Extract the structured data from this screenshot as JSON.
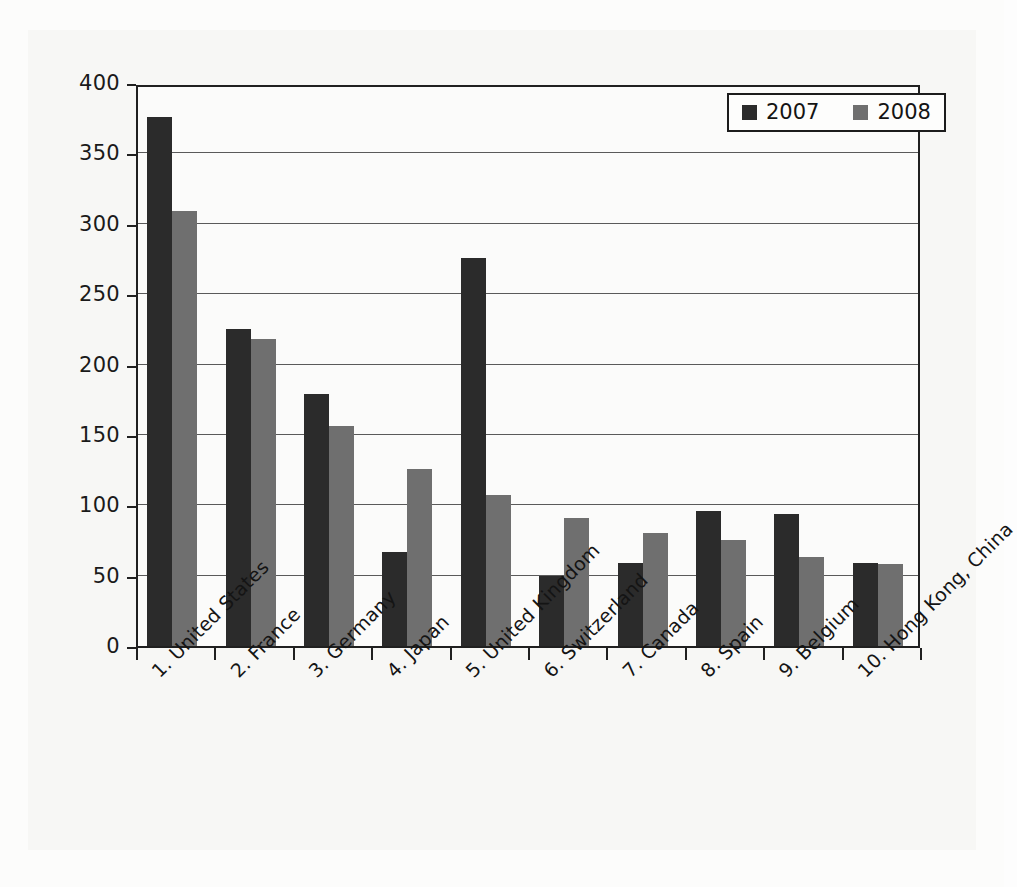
{
  "chart_data": {
    "type": "bar",
    "title": "",
    "subtitle": "",
    "xlabel": "",
    "ylabel": "",
    "ylim": [
      0,
      400
    ],
    "ytick_step": 50,
    "yticks": [
      "0",
      "50",
      "100",
      "150",
      "200",
      "250",
      "300",
      "350",
      "400"
    ],
    "grid": true,
    "grid_axis": "y",
    "legend_position": "top-right",
    "categories": [
      "1. United States",
      "2. France",
      "3. Germany",
      "4. Japan",
      "5. United Kingdom",
      "6. Switzerland",
      "7. Canada",
      "8. Spain",
      "9. Belgium",
      "10. Hong Kong, China"
    ],
    "series": [
      {
        "name": "2007",
        "color": "#2b2b2b",
        "values": [
          376,
          225,
          179,
          67,
          276,
          50,
          59,
          96,
          94,
          59
        ]
      },
      {
        "name": "2008",
        "color": "#6f6f6f",
        "values": [
          309,
          218,
          156,
          126,
          107,
          91,
          80,
          75,
          63,
          58
        ]
      }
    ]
  },
  "legend": {
    "entries": [
      {
        "label": "2007",
        "color": "#2b2b2b"
      },
      {
        "label": "2008",
        "color": "#6f6f6f"
      }
    ]
  },
  "colors": {
    "series_2007": "#2b2b2b",
    "series_2008": "#6f6f6f",
    "axis": "#202020",
    "gridline": "#5a5a5a",
    "background": "#fbfbfa"
  }
}
